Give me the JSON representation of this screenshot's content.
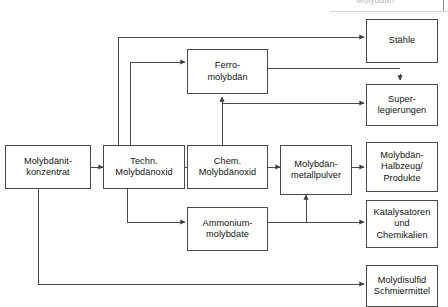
{
  "diagram": {
    "title_fragment": "Molybdän",
    "colors": {
      "line": "#4a4a4a",
      "box_border": "#4a4a4a",
      "background": "#ffffff",
      "text": "#141414"
    },
    "nodes": [
      {
        "id": "konzentrat",
        "label": "Molybdänit-\nkonzentrat"
      },
      {
        "id": "techn_oxid",
        "label": "Techn.\nMolybdänoxid"
      },
      {
        "id": "chem_oxid",
        "label": "Chem.\nMolybdänoxid"
      },
      {
        "id": "metallpulver",
        "label": "Molybdän-\nmetallpulver"
      },
      {
        "id": "ferromolybdaen",
        "label": "Ferro-\nmolybdän"
      },
      {
        "id": "ammonium",
        "label": "Ammonium-\nmolybdate"
      },
      {
        "id": "staehle",
        "label": "Stähle"
      },
      {
        "id": "superlegierungen",
        "label": "Super-\nlegierungen"
      },
      {
        "id": "halbzeug",
        "label": "Molybdän-\nHalbzeug/\nProdukte"
      },
      {
        "id": "katalysatoren",
        "label": "Katalysatoren\nund\nChemikalien"
      },
      {
        "id": "schmiermittel",
        "label": "Molydisulfid\nSchmiermittel"
      }
    ],
    "edges": [
      {
        "from": "konzentrat",
        "to": "techn_oxid"
      },
      {
        "from": "techn_oxid",
        "to": "chem_oxid"
      },
      {
        "from": "chem_oxid",
        "to": "metallpulver"
      },
      {
        "from": "metallpulver",
        "to": "halbzeug"
      },
      {
        "from": "techn_oxid",
        "to": "staehle"
      },
      {
        "from": "techn_oxid",
        "to": "ferromolybdaen"
      },
      {
        "from": "techn_oxid",
        "to": "ammonium"
      },
      {
        "from": "chem_oxid",
        "to": "ferromolybdaen"
      },
      {
        "from": "chem_oxid",
        "to": "superlegierungen"
      },
      {
        "from": "ferromolybdaen",
        "to": "staehle"
      },
      {
        "from": "ammonium",
        "to": "katalysatoren"
      },
      {
        "from": "ammonium",
        "to": "metallpulver"
      },
      {
        "from": "konzentrat",
        "to": "schmiermittel"
      },
      {
        "from": "staehle",
        "to": "superlegierungen",
        "bidirectional": true
      }
    ]
  }
}
